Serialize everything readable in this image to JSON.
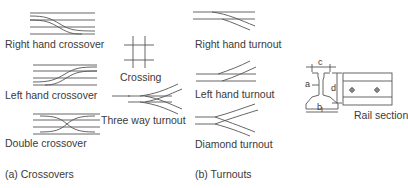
{
  "figure": {
    "crossovers": {
      "caption": "(a) Crossovers",
      "items": [
        {
          "label": "Right hand crossover"
        },
        {
          "label": "Left hand crossover"
        },
        {
          "label": "Double crossover"
        }
      ]
    },
    "crossing": {
      "label": "Crossing"
    },
    "three_way": {
      "label": "Three way turnout"
    },
    "turnouts": {
      "caption": "(b) Turnouts",
      "items": [
        {
          "label": "Right hand turnout"
        },
        {
          "label": "Left hand turnout"
        },
        {
          "label": "Diamond turnout"
        }
      ]
    },
    "rail_section": {
      "label": "Rail section",
      "dims": {
        "a": "a",
        "b": "b",
        "c": "c",
        "d": "d"
      }
    }
  }
}
